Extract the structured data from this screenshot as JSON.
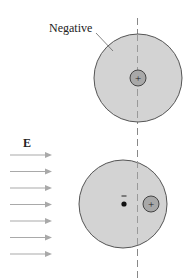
{
  "labels": {
    "negative": "Negative",
    "field": "E",
    "plus": "+",
    "minus": "−"
  },
  "colors": {
    "cloud": "#d3d3d3",
    "cloud_stroke": "#555555",
    "nucleus": "#a8a8a8",
    "arrow": "#a9a9a9",
    "axis": "#888888"
  },
  "diagram": {
    "top_atom": {
      "cx": 138,
      "cy": 78,
      "r": 44,
      "nucleus_cx": 138,
      "nucleus_cy": 78,
      "nucleus_r": 8
    },
    "bottom_atom": {
      "cx": 123,
      "cy": 204,
      "r": 44,
      "nucleus_cx": 151,
      "nucleus_cy": 204,
      "nucleus_r": 8,
      "electron_cx": 124,
      "electron_cy": 204
    },
    "field_arrows": 7
  }
}
